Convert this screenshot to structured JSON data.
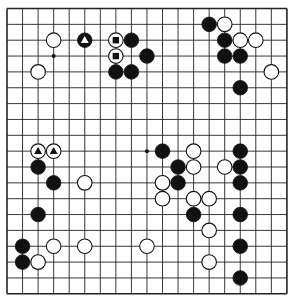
{
  "board": {
    "size": 19,
    "origin_x": 7,
    "origin_y": 8.5,
    "spacing_x": 15.55,
    "spacing_y": 15.85,
    "stone_radius": 7.3,
    "line_color": "#222222",
    "background": "#ffffff",
    "hoshi_visible": [
      [
        3,
        3
      ],
      [
        9,
        9
      ]
    ]
  },
  "stones": [
    {
      "color": "white",
      "col": 3,
      "row": 2
    },
    {
      "color": "black",
      "col": 5,
      "row": 2,
      "marker": "triangle"
    },
    {
      "color": "white",
      "col": 7,
      "row": 2,
      "marker": "square"
    },
    {
      "color": "black",
      "col": 8,
      "row": 2
    },
    {
      "color": "white",
      "col": 7,
      "row": 3,
      "marker": "square"
    },
    {
      "color": "black",
      "col": 9,
      "row": 3
    },
    {
      "color": "white",
      "col": 2,
      "row": 4
    },
    {
      "color": "black",
      "col": 7,
      "row": 4
    },
    {
      "color": "black",
      "col": 8,
      "row": 4
    },
    {
      "color": "black",
      "col": 13,
      "row": 1
    },
    {
      "color": "white",
      "col": 14,
      "row": 1
    },
    {
      "color": "black",
      "col": 14,
      "row": 2
    },
    {
      "color": "white",
      "col": 15,
      "row": 2
    },
    {
      "color": "white",
      "col": 16,
      "row": 2
    },
    {
      "color": "black",
      "col": 14,
      "row": 3
    },
    {
      "color": "black",
      "col": 15,
      "row": 3
    },
    {
      "color": "white",
      "col": 17,
      "row": 4
    },
    {
      "color": "black",
      "col": 15,
      "row": 5
    },
    {
      "color": "white",
      "col": 2,
      "row": 9,
      "marker": "triangle"
    },
    {
      "color": "white",
      "col": 3,
      "row": 9,
      "marker": "triangle"
    },
    {
      "color": "black",
      "col": 2,
      "row": 10
    },
    {
      "color": "black",
      "col": 3,
      "row": 11
    },
    {
      "color": "white",
      "col": 5,
      "row": 11
    },
    {
      "color": "black",
      "col": 2,
      "row": 13
    },
    {
      "color": "black",
      "col": 1,
      "row": 15
    },
    {
      "color": "white",
      "col": 3,
      "row": 15
    },
    {
      "color": "white",
      "col": 5,
      "row": 15
    },
    {
      "color": "black",
      "col": 1,
      "row": 16
    },
    {
      "color": "white",
      "col": 2,
      "row": 16
    },
    {
      "color": "black",
      "col": 10,
      "row": 9
    },
    {
      "color": "white",
      "col": 12,
      "row": 9
    },
    {
      "color": "black",
      "col": 15,
      "row": 9
    },
    {
      "color": "black",
      "col": 11,
      "row": 10
    },
    {
      "color": "white",
      "col": 12,
      "row": 10
    },
    {
      "color": "white",
      "col": 14,
      "row": 10
    },
    {
      "color": "black",
      "col": 15,
      "row": 10
    },
    {
      "color": "white",
      "col": 10,
      "row": 11
    },
    {
      "color": "black",
      "col": 11,
      "row": 11
    },
    {
      "color": "black",
      "col": 15,
      "row": 11
    },
    {
      "color": "white",
      "col": 10,
      "row": 12
    },
    {
      "color": "white",
      "col": 12,
      "row": 12
    },
    {
      "color": "white",
      "col": 13,
      "row": 12
    },
    {
      "color": "black",
      "col": 12,
      "row": 13
    },
    {
      "color": "black",
      "col": 15,
      "row": 13
    },
    {
      "color": "white",
      "col": 13,
      "row": 14
    },
    {
      "color": "white",
      "col": 9,
      "row": 15
    },
    {
      "color": "black",
      "col": 15,
      "row": 15
    },
    {
      "color": "white",
      "col": 13,
      "row": 16
    },
    {
      "color": "black",
      "col": 15,
      "row": 17
    }
  ]
}
